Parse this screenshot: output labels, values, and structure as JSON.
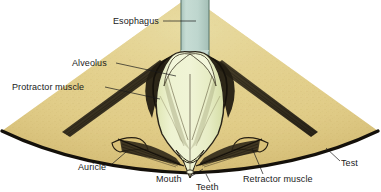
{
  "figure": {
    "width": 381,
    "height": 192,
    "background": "#ffffff"
  },
  "colors": {
    "page_background": "#ffffff",
    "test_body_sand": "#e2ce8a",
    "test_body_sand_dark": "#cdb66e",
    "test_outline": "#1a1208",
    "lantern_pale": "#eaf0c8",
    "lantern_shadow": "#d8e0ae",
    "esophagus": "#bcd4cc",
    "esophagus_edge": "#9fbcb2",
    "muscle_dark": "#2b2418",
    "tooth_tip": "#e8eec6",
    "label_text": "#1a1a1a",
    "leader_line": "#1a1a1a"
  },
  "labels": [
    {
      "id": "esophagus",
      "text": "Esophagus",
      "text_x": 113,
      "text_y": 24,
      "anchor": "start",
      "leader": "M 163 21 L 172 21 L 196 21",
      "side": "left"
    },
    {
      "id": "alveolus",
      "text": "Alveolus",
      "text_x": 72,
      "text_y": 66,
      "anchor": "start",
      "leader": "M 116 63 L 176 76",
      "side": "left"
    },
    {
      "id": "protractor-muscle",
      "text": "Protractor muscle",
      "text_x": 12,
      "text_y": 90,
      "anchor": "start",
      "leader": "M 105 87 L 160 99",
      "side": "left"
    },
    {
      "id": "auricle",
      "text": "Auricle",
      "text_x": 78,
      "text_y": 170,
      "anchor": "start",
      "leader": "M 112 164 L 126 154",
      "side": "left"
    },
    {
      "id": "mouth",
      "text": "Mouth",
      "text_x": 156,
      "text_y": 182,
      "anchor": "start",
      "leader": "M 190 177 L 203 169",
      "side": "left"
    },
    {
      "id": "teeth",
      "text": "Teeth",
      "text_x": 196,
      "text_y": 190,
      "anchor": "start",
      "leader": "M 210 181 L 207 174",
      "side": "center"
    },
    {
      "id": "retractor-muscle",
      "text": "Retractor muscle",
      "text_x": 243,
      "text_y": 182,
      "anchor": "start",
      "leader": "M 263 174 L 255 146",
      "side": "right"
    },
    {
      "id": "test",
      "text": "Test",
      "text_x": 341,
      "text_y": 166,
      "anchor": "start",
      "leader": "M 339 161 L 326 148",
      "side": "right"
    }
  ],
  "structures": [
    {
      "id": "test-wedge",
      "name": "Test (skeletal shell wedge)"
    },
    {
      "id": "esophagus-tube",
      "name": "Esophagus tube"
    },
    {
      "id": "lantern-body",
      "name": "Aristotle's lantern body"
    },
    {
      "id": "alveolus-left",
      "name": "Left alveolus"
    },
    {
      "id": "alveolus-right",
      "name": "Right alveolus"
    },
    {
      "id": "protractor-left",
      "name": "Left protractor muscle"
    },
    {
      "id": "protractor-right",
      "name": "Right protractor muscle"
    },
    {
      "id": "retractor-left",
      "name": "Left retractor muscle"
    },
    {
      "id": "retractor-right",
      "name": "Right retractor muscle"
    },
    {
      "id": "auricle-left",
      "name": "Left auricle"
    },
    {
      "id": "auricle-right",
      "name": "Right auricle"
    },
    {
      "id": "teeth-group",
      "name": "Teeth converging at mouth"
    },
    {
      "id": "mouth-opening",
      "name": "Mouth opening"
    }
  ]
}
